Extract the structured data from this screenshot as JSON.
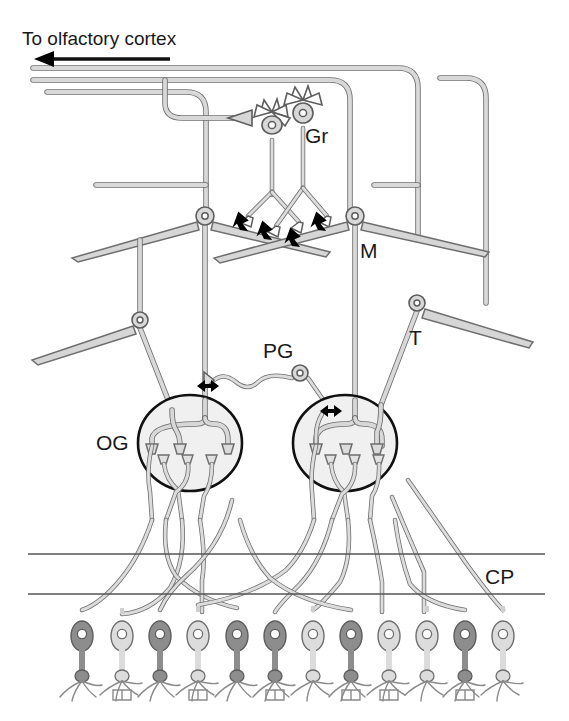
{
  "figure": {
    "title": "To olfactory cortex",
    "domain": "Diagram",
    "background_color": "#ffffff",
    "ink_color": "#1a1a1a",
    "process_fill": "#d5d5d5",
    "process_stroke": "#6e6e6e",
    "glomerulus_fill": "#f0f0f0",
    "receptor_dark_fill": "#8d8d8d",
    "receptor_light_fill": "#dcdcdc",
    "synapse_color": "#000000"
  },
  "labels": [
    {
      "id": "to-olfactory-cortex",
      "text": "To olfactory cortex",
      "x": 22,
      "y": 45,
      "size": 19,
      "meaning": "output projection direction"
    },
    {
      "id": "gr",
      "text": "Gr",
      "x": 305,
      "y": 143,
      "size": 21,
      "meaning": "granule cell"
    },
    {
      "id": "m",
      "text": "M",
      "x": 360,
      "y": 258,
      "size": 21,
      "meaning": "mitral cell"
    },
    {
      "id": "t",
      "text": "T",
      "x": 409,
      "y": 345,
      "size": 21,
      "meaning": "tufted cell"
    },
    {
      "id": "pg",
      "text": "PG",
      "x": 263,
      "y": 358,
      "size": 21,
      "meaning": "periglomerular cell"
    },
    {
      "id": "og",
      "text": "OG",
      "x": 96,
      "y": 450,
      "size": 21,
      "meaning": "olfactory glomerulus"
    },
    {
      "id": "cp",
      "text": "CP",
      "x": 485,
      "y": 584,
      "size": 21,
      "meaning": "cribriform plate"
    }
  ],
  "arrow": {
    "name": "to-olfactory-cortex-arrow",
    "direction": "left",
    "x1": 168,
    "x2": 35,
    "y": 58
  },
  "cribriform_plate": {
    "line_top_y": 554,
    "line_bottom_y": 594,
    "x_start": 28,
    "x_end": 545,
    "color": "#555555"
  },
  "glomeruli": [
    {
      "id": "og-left",
      "cx": 190,
      "cy": 443,
      "rx": 52,
      "ry": 48
    },
    {
      "id": "og-right",
      "cx": 345,
      "cy": 443,
      "rx": 52,
      "ry": 48
    }
  ],
  "cells": {
    "granule": [
      {
        "id": "gr-left",
        "soma_x": 272,
        "soma_y": 128
      },
      {
        "id": "gr-right",
        "soma_x": 303,
        "soma_y": 115
      }
    ],
    "mitral": [
      {
        "id": "m-left",
        "soma_x": 205,
        "soma_y": 216
      },
      {
        "id": "m-right",
        "soma_x": 355,
        "soma_y": 216
      }
    ],
    "tufted": [
      {
        "id": "t-lower-left",
        "soma_x": 140,
        "soma_y": 320
      },
      {
        "id": "t-right",
        "soma_x": 417,
        "soma_y": 303
      }
    ],
    "periglomerular": [
      {
        "id": "pg-cell",
        "soma_x": 300,
        "soma_y": 373
      }
    ]
  },
  "receptor_neurons": [
    {
      "index": 1,
      "x": 82,
      "shade": "dark"
    },
    {
      "index": 2,
      "x": 122,
      "shade": "light"
    },
    {
      "index": 3,
      "x": 160,
      "shade": "dark"
    },
    {
      "index": 4,
      "x": 198,
      "shade": "light"
    },
    {
      "index": 5,
      "x": 237,
      "shade": "dark"
    },
    {
      "index": 6,
      "x": 275,
      "shade": "dark"
    },
    {
      "index": 7,
      "x": 313,
      "shade": "light"
    },
    {
      "index": 8,
      "x": 351,
      "shade": "dark"
    },
    {
      "index": 9,
      "x": 389,
      "shade": "light"
    },
    {
      "index": 10,
      "x": 427,
      "shade": "light"
    },
    {
      "index": 11,
      "x": 465,
      "shade": "dark"
    },
    {
      "index": 12,
      "x": 503,
      "shade": "light"
    }
  ],
  "synapses": [
    {
      "id": "syn-gr-1",
      "x": 244,
      "y": 222,
      "rotation": 20,
      "type": "dendrodendritic"
    },
    {
      "id": "syn-gr-2",
      "x": 268,
      "y": 231,
      "rotation": 20,
      "type": "dendrodendritic"
    },
    {
      "id": "syn-gr-3",
      "x": 294,
      "y": 236,
      "rotation": 20,
      "type": "dendrodendritic"
    },
    {
      "id": "syn-gr-4",
      "x": 322,
      "y": 222,
      "rotation": 20,
      "type": "dendrodendritic"
    },
    {
      "id": "syn-pg-left",
      "x": 208,
      "y": 385,
      "rotation": 180,
      "type": "reciprocal"
    },
    {
      "id": "syn-pg-right",
      "x": 330,
      "y": 410,
      "rotation": 0,
      "type": "reciprocal"
    }
  ],
  "centrifugal_input": {
    "id": "centrifugal-axon-terminal",
    "terminal_x": 250,
    "terminal_y": 128,
    "description": "centrifugal axon terminal onto granule cell"
  }
}
